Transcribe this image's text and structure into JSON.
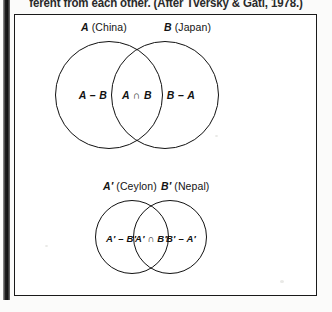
{
  "caption": {
    "text": "ferent from each other.  (After Tversky & Gati, 1978.)"
  },
  "figure": {
    "upper_diagram": {
      "name": "upper-venn",
      "left_set": {
        "symbol": "A",
        "country": "(China)"
      },
      "right_set": {
        "symbol": "B",
        "country": "(Japan)"
      },
      "regions": {
        "left_only": "A – B",
        "intersection": "A ∩ B",
        "right_only": "B – A"
      }
    },
    "lower_diagram": {
      "name": "lower-venn",
      "left_set": {
        "symbol": "A′",
        "country": "(Ceylon)"
      },
      "right_set": {
        "symbol": "B′",
        "country": "(Nepal)"
      },
      "regions": {
        "left_only": "A′ – B′",
        "intersection": "A′ ∩ B′",
        "right_only": "B′ – A′"
      }
    }
  },
  "colors": {
    "ink": "#111111",
    "paper": "#ffffff",
    "gutter": "#1d1d1d"
  }
}
